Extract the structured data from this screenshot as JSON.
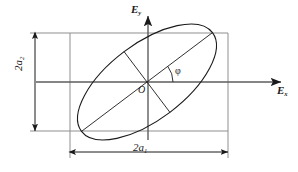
{
  "figure": {
    "type": "geometry-diagram",
    "background_color": "#ffffff",
    "stroke_color": "#1a1a1a",
    "guide_color": "#8a8a8a"
  },
  "axes": {
    "vertical": {
      "label": "E",
      "subscript": "y",
      "name": "vertical-axis",
      "x": 148,
      "y_top": 14,
      "y_bottom": 140,
      "arrow": "up"
    },
    "horizontal": {
      "label": "E",
      "subscript": "x",
      "name": "horizontal-axis",
      "y": 82,
      "x_left": 36,
      "x_right": 283,
      "arrow": "right"
    },
    "origin": {
      "label": "O",
      "x": 147,
      "y": 82
    }
  },
  "ellipse": {
    "center_x": 147,
    "center_y": 82,
    "semi_major": 82,
    "semi_minor": 38,
    "rotation_deg": -37,
    "stroke_width": 1
  },
  "angle": {
    "symbol": "φ",
    "label": "φ",
    "value_deg": 37,
    "arc_radius": 26,
    "description": "angle between major axis and Ex axis"
  },
  "dimensions": {
    "width": {
      "label": "2a",
      "subscript": "1",
      "name": "horizontal-dimension",
      "y": 152,
      "x_start": 70,
      "x_end": 228
    },
    "height": {
      "label": "2a",
      "subscript": "2",
      "name": "vertical-dimension",
      "x": 35,
      "y_start": 33,
      "y_end": 131
    }
  },
  "bounding_box": {
    "name": "tangent-rectangle",
    "x_left": 70,
    "x_right": 228,
    "y_top": 33,
    "y_bottom": 131
  }
}
